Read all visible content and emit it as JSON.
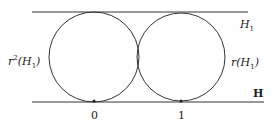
{
  "diagram": {
    "lines": [
      {
        "name": "H1-line",
        "y": 12,
        "x1": 32,
        "x2": 248
      },
      {
        "name": "H-line",
        "y": 102,
        "x1": 32,
        "x2": 264
      }
    ],
    "circles": [
      {
        "name": "left-circle",
        "cx": 94,
        "cy": 57,
        "r": 45
      },
      {
        "name": "right-circle",
        "cx": 181,
        "cy": 57,
        "r": 44
      }
    ],
    "points": [
      {
        "name": "point-0",
        "x": 94,
        "y": 101
      },
      {
        "name": "point-1",
        "x": 181,
        "y": 101
      }
    ],
    "labels": {
      "h1_top": {
        "base": "H",
        "sub": "1"
      },
      "r2_h1": {
        "pre": "r",
        "sup": "2",
        "mid": "(H",
        "sub": "1",
        "post": ")"
      },
      "r_h1": {
        "pre": "r(H",
        "sub": "1",
        "post": ")"
      },
      "blackboard_h": "H",
      "zero": "0",
      "one": "1"
    },
    "colors": {
      "stroke": "#333333",
      "background": "#ffffff"
    }
  }
}
